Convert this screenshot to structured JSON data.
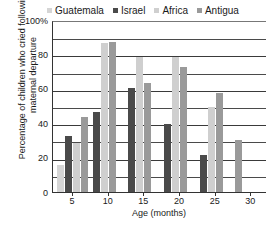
{
  "chart_data": {
    "type": "bar",
    "title": "",
    "xlabel": "Age (months)",
    "ylabel": "Percentage of children who cried following maternal departure",
    "categories": [
      "5",
      "10",
      "15",
      "20",
      "25",
      "30"
    ],
    "ylim": [
      0,
      100
    ],
    "ytick_labels": [
      "0",
      "20",
      "40",
      "60",
      "80",
      "100%"
    ],
    "ytick_values": [
      0,
      20,
      40,
      60,
      80,
      100
    ],
    "minor_gridline_values": [
      10,
      30,
      50,
      70,
      90
    ],
    "grid": true,
    "legend_position": "top",
    "series": [
      {
        "name": "Guatemala",
        "color": "#d5d5d5",
        "values": [
          16,
          null,
          null,
          null,
          null,
          null
        ]
      },
      {
        "name": "Israel",
        "color": "#4a4a4a",
        "values": [
          33,
          47,
          61,
          40,
          22,
          null
        ]
      },
      {
        "name": "Africa",
        "color": "#cfcfcf",
        "values": [
          29,
          87,
          79,
          79,
          50,
          null
        ]
      },
      {
        "name": "Antigua",
        "color": "#9a9a9a",
        "values": [
          44,
          88,
          64,
          73,
          58,
          31
        ]
      }
    ]
  },
  "legend": {
    "entries": [
      {
        "label": "Guatemala",
        "color": "#d5d5d5"
      },
      {
        "label": "Israel",
        "color": "#4a4a4a"
      },
      {
        "label": "Africa",
        "color": "#cfcfcf"
      },
      {
        "label": "Antigua",
        "color": "#9a9a9a"
      }
    ]
  },
  "axes": {
    "y_title": "Percentage of children who cried following maternal departure",
    "x_title": "Age (months)"
  }
}
